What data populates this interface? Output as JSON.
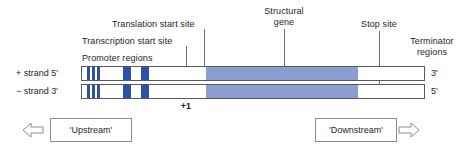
{
  "diagram": {
    "type": "gene-structure-schematic",
    "colors": {
      "promoter_block": "#2a52a8",
      "structural_gene": "#8a9ed2",
      "outline": "#58595b",
      "leader_line": "#6d6e71",
      "text": "#231f20",
      "box_border": "#8c8c8c",
      "background": "#ffffff"
    },
    "callouts": [
      {
        "id": "translation-start-site",
        "label": "Translation start site"
      },
      {
        "id": "transcription-start-site",
        "label": "Transcription start site"
      },
      {
        "id": "promoter-regions",
        "label": "Promoter regions"
      },
      {
        "id": "structural-gene",
        "label_line1": "Structural",
        "label_line2": "gene"
      },
      {
        "id": "stop-site",
        "label": "Stop site"
      },
      {
        "id": "terminator-regions",
        "label_line1": "Terminator",
        "label_line2": "regions"
      }
    ],
    "strands": [
      {
        "id": "plus-strand",
        "left_label": "+ strand 5'",
        "right_label": "3'",
        "segments": [
          {
            "kind": "promoter",
            "x": 5,
            "width": 3
          },
          {
            "kind": "promoter",
            "x": 10,
            "width": 3
          },
          {
            "kind": "promoter",
            "x": 15,
            "width": 3
          },
          {
            "kind": "promoter",
            "x": 41,
            "width": 8
          },
          {
            "kind": "promoter",
            "x": 59,
            "width": 8
          },
          {
            "kind": "gene",
            "x": 124,
            "width": 152
          }
        ]
      },
      {
        "id": "minus-strand",
        "left_label": "− strand 3'",
        "right_label": "5'",
        "segments": [
          {
            "kind": "promoter",
            "x": 5,
            "width": 3
          },
          {
            "kind": "promoter",
            "x": 10,
            "width": 3
          },
          {
            "kind": "promoter",
            "x": 15,
            "width": 3
          },
          {
            "kind": "promoter",
            "x": 41,
            "width": 8
          },
          {
            "kind": "promoter",
            "x": 59,
            "width": 8
          },
          {
            "kind": "gene",
            "x": 124,
            "width": 152
          }
        ]
      }
    ],
    "position_marker": "+1",
    "direction_boxes": [
      {
        "id": "upstream",
        "label": "'Upstream'",
        "arrow": "left-arrow-icon"
      },
      {
        "id": "downstream",
        "label": "'Downstream'",
        "arrow": "right-arrow-icon"
      }
    ]
  }
}
